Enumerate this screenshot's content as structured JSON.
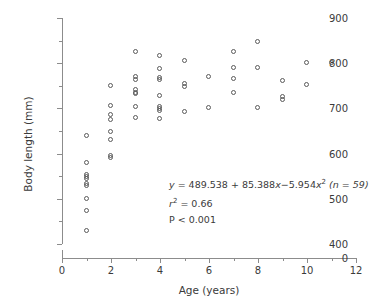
{
  "chart_data": {
    "type": "scatter",
    "title": "",
    "xlabel": "Age (years)",
    "ylabel": "Body length (mm)",
    "xlim": [
      0,
      12
    ],
    "ylim": [
      400,
      900
    ],
    "y_axis_break": true,
    "y_break_from": 0,
    "y_break_to": 400,
    "xticks": [
      0,
      2,
      4,
      6,
      8,
      10,
      12
    ],
    "xticks_minor": [
      1,
      3,
      5,
      7,
      9,
      11
    ],
    "yticks": [
      400,
      500,
      600,
      700,
      800,
      900
    ],
    "yticks_minor": [
      450,
      550,
      650,
      750,
      850
    ],
    "ytick_zero_label": "0",
    "grid": false,
    "legend": false,
    "marker": "open-circle",
    "marker_color": "#5a5a5a",
    "axis_color": "#8c8c8c",
    "text_color": "#3a3a3a",
    "n_points": 59,
    "points": [
      {
        "x": 1,
        "y": 640
      },
      {
        "x": 1,
        "y": 580
      },
      {
        "x": 1,
        "y": 553
      },
      {
        "x": 1,
        "y": 548
      },
      {
        "x": 1,
        "y": 544
      },
      {
        "x": 1,
        "y": 533
      },
      {
        "x": 1,
        "y": 528
      },
      {
        "x": 1,
        "y": 500
      },
      {
        "x": 1,
        "y": 472
      },
      {
        "x": 1,
        "y": 428
      },
      {
        "x": 2,
        "y": 750
      },
      {
        "x": 2,
        "y": 705
      },
      {
        "x": 2,
        "y": 685
      },
      {
        "x": 2,
        "y": 675
      },
      {
        "x": 2,
        "y": 648
      },
      {
        "x": 2,
        "y": 630
      },
      {
        "x": 2,
        "y": 595
      },
      {
        "x": 2,
        "y": 590
      },
      {
        "x": 3,
        "y": 825
      },
      {
        "x": 3,
        "y": 770
      },
      {
        "x": 3,
        "y": 762
      },
      {
        "x": 3,
        "y": 740
      },
      {
        "x": 3,
        "y": 735
      },
      {
        "x": 3,
        "y": 731
      },
      {
        "x": 3,
        "y": 703
      },
      {
        "x": 3,
        "y": 678
      },
      {
        "x": 4,
        "y": 815
      },
      {
        "x": 4,
        "y": 787
      },
      {
        "x": 4,
        "y": 768
      },
      {
        "x": 4,
        "y": 762
      },
      {
        "x": 4,
        "y": 727
      },
      {
        "x": 4,
        "y": 703
      },
      {
        "x": 4,
        "y": 698
      },
      {
        "x": 4,
        "y": 694
      },
      {
        "x": 4,
        "y": 676
      },
      {
        "x": 5,
        "y": 805
      },
      {
        "x": 5,
        "y": 753
      },
      {
        "x": 5,
        "y": 748
      },
      {
        "x": 5,
        "y": 692
      },
      {
        "x": 6,
        "y": 770
      },
      {
        "x": 6,
        "y": 700
      },
      {
        "x": 7,
        "y": 825
      },
      {
        "x": 7,
        "y": 790
      },
      {
        "x": 7,
        "y": 765
      },
      {
        "x": 7,
        "y": 735
      },
      {
        "x": 8,
        "y": 848
      },
      {
        "x": 8,
        "y": 790
      },
      {
        "x": 8,
        "y": 700
      },
      {
        "x": 9,
        "y": 760
      },
      {
        "x": 9,
        "y": 726
      },
      {
        "x": 9,
        "y": 718
      },
      {
        "x": 10,
        "y": 800
      },
      {
        "x": 10,
        "y": 752
      },
      {
        "x": 11,
        "y": 800
      }
    ],
    "annotation": {
      "equation_prefix": "y",
      "equation_body": " = 489.538 + 85.388",
      "equation_x1": "x",
      "equation_mid": "−5.954",
      "equation_x2": "x",
      "equation_sup": "2",
      "equation_n": " (n = 59)",
      "r2_symbol": "r",
      "r2_sup": "2",
      "r2_value": " = 0.66",
      "p_value": "P < 0.001"
    }
  }
}
